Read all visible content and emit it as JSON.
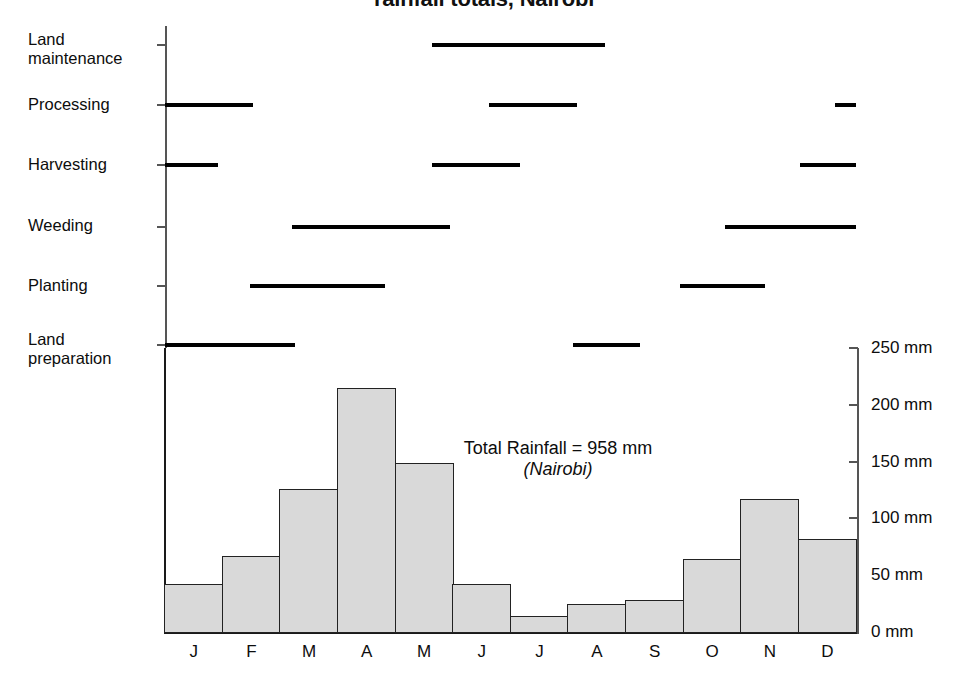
{
  "title": "rainfall totals, Nairobi",
  "gantt": {
    "rows": [
      {
        "label": "Land\nmaintenance",
        "name": "land-maintenance"
      },
      {
        "label": "Processing",
        "name": "processing"
      },
      {
        "label": "Harvesting",
        "name": "harvesting"
      },
      {
        "label": "Weeding",
        "name": "weeding"
      },
      {
        "label": "Planting",
        "name": "planting"
      },
      {
        "label": "Land\npreparation",
        "name": "land-preparation"
      }
    ]
  },
  "annotation": {
    "total_rainfall": "Total Rainfall = 958 mm",
    "location": "(Nairobi)"
  },
  "chart_data": {
    "type": "bar",
    "title": "rainfall totals, Nairobi",
    "xlabel": "",
    "ylabel": "mm",
    "ylim": [
      0,
      250
    ],
    "yticks": [
      0,
      50,
      100,
      150,
      200,
      250
    ],
    "ytick_labels": [
      "0 mm",
      "50 mm",
      "100 mm",
      "150 mm",
      "200 mm",
      "250 mm"
    ],
    "grid": false,
    "legend": "none",
    "categories": [
      "J",
      "F",
      "M",
      "A",
      "M",
      "J",
      "J",
      "A",
      "S",
      "O",
      "N",
      "D"
    ],
    "month_names": [
      "January",
      "February",
      "March",
      "April",
      "May",
      "June",
      "July",
      "August",
      "September",
      "October",
      "November",
      "December"
    ],
    "values": [
      42,
      67,
      126,
      215,
      149,
      42,
      14,
      25,
      28,
      64,
      117,
      82
    ],
    "total": 958,
    "units": "mm",
    "bar_fill": "#d9d9d9",
    "bar_stroke": "#222222",
    "annotations": [
      "Total Rainfall = 958 mm",
      "(Nairobi)"
    ],
    "activities": [
      {
        "name": "Land maintenance",
        "periods": [
          [
            4.63,
            7.64
          ]
        ]
      },
      {
        "name": "Processing",
        "periods": [
          [
            0.0,
            1.53
          ],
          [
            5.63,
            7.15
          ],
          [
            11.63,
            12.0
          ]
        ]
      },
      {
        "name": "Harvesting",
        "periods": [
          [
            0.0,
            0.92
          ],
          [
            4.63,
            6.16
          ],
          [
            11.02,
            12.0
          ]
        ]
      },
      {
        "name": "Weeding",
        "periods": [
          [
            2.2,
            4.95
          ],
          [
            9.72,
            12.0
          ]
        ]
      },
      {
        "name": "Planting",
        "periods": [
          [
            1.48,
            3.82
          ],
          [
            8.94,
            10.42
          ]
        ]
      },
      {
        "name": "Land preparation",
        "periods": [
          [
            0.0,
            2.26
          ],
          [
            7.08,
            8.25
          ]
        ]
      }
    ]
  }
}
